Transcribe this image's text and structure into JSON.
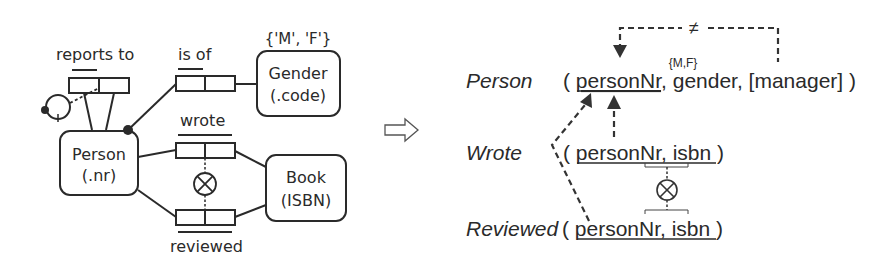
{
  "orm_schema": {
    "entities": [
      {
        "name": "Person",
        "ref": "(.nr)"
      },
      {
        "name": "Gender",
        "ref": "(.code)",
        "value_constraint": "{'M', 'F'}"
      },
      {
        "name": "Book",
        "ref": "(ISBN)"
      }
    ],
    "fact_types": [
      {
        "reading": "reports to",
        "roles": [
          "Person",
          "Person"
        ],
        "constraint": "ring (irreflexive)"
      },
      {
        "reading": "is of",
        "roles": [
          "Person",
          "Gender"
        ],
        "mandatory": true
      },
      {
        "reading": "wrote",
        "roles": [
          "Person",
          "Book"
        ]
      },
      {
        "reading": "reviewed",
        "roles": [
          "Person",
          "Book"
        ]
      }
    ],
    "exclusion_symbol": "⊗"
  },
  "mapping_arrow": "⇨",
  "relational_schema": {
    "tables": [
      {
        "name": "Person",
        "open": "( ",
        "key": "personNr",
        "rest": ", gender, [manager] )",
        "value_constraint": "{M,F}"
      },
      {
        "name": "Wrote",
        "open": "( ",
        "key": "personNr, isbn",
        "rest": " )"
      },
      {
        "name": "Reviewed",
        "open": "( ",
        "key": "personNr, isbn",
        "rest": " )"
      }
    ],
    "inequality_symbol": "≠",
    "exclusion_symbol": "⊗"
  }
}
